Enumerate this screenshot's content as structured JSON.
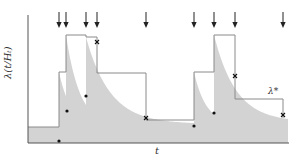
{
  "chart_data": {
    "type": "area",
    "title": "",
    "xlabel": "t",
    "ylabel": "λ(t|Hₜ)",
    "annotation": "λ*",
    "grid": false,
    "legend": null,
    "event_arrow_x": [
      59,
      66,
      86,
      97,
      146,
      194,
      214,
      235,
      283
    ],
    "upper_bound_steps": [
      {
        "x0": 28,
        "x1": 59,
        "y": 127
      },
      {
        "x0": 59,
        "x1": 66,
        "y": 72
      },
      {
        "x0": 66,
        "x1": 86,
        "y": 35
      },
      {
        "x0": 86,
        "x1": 97,
        "y": 37
      },
      {
        "x0": 97,
        "x1": 146,
        "y": 73
      },
      {
        "x0": 146,
        "x1": 194,
        "y": 120
      },
      {
        "x0": 194,
        "x1": 214,
        "y": 72
      },
      {
        "x0": 214,
        "x1": 235,
        "y": 35
      },
      {
        "x0": 235,
        "x1": 283,
        "y": 99
      }
    ],
    "rejected_points": [
      [
        97,
        42
      ],
      [
        146,
        118
      ],
      [
        235,
        76
      ],
      [
        283,
        115
      ]
    ],
    "accepted_points": [
      [
        59,
        141
      ],
      [
        67,
        111
      ],
      [
        86,
        96
      ],
      [
        194,
        126
      ],
      [
        214,
        113
      ]
    ],
    "colors": {
      "fill": "#d3d3d3",
      "line": "#8a8a8a",
      "axis": "#555555",
      "marker": "#111111"
    }
  },
  "labels": {
    "ylabel": "λ(t/Hₜ)",
    "xlabel": "t",
    "lambda_star": "λ*"
  }
}
